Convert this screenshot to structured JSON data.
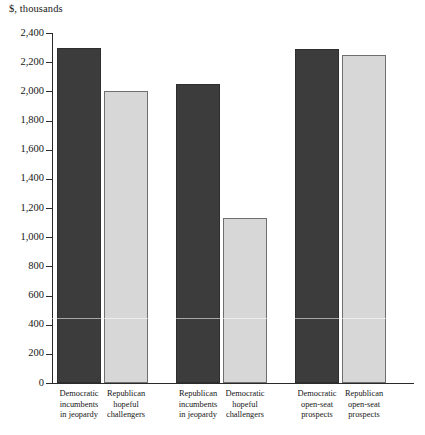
{
  "chart_data": {
    "type": "bar",
    "title": "",
    "subtitle": "",
    "axis_caption": "$, thousands",
    "xlabel": "",
    "ylabel": "$, thousands",
    "ylim": [
      0,
      2400
    ],
    "ytick_step": 200,
    "grid": false,
    "legend": "none",
    "categories": [
      "Democratic incumbents in jeopardy",
      "Republican hopeful challengers",
      "Republican incumbents in jeopardy",
      "Democratic hopeful challengers",
      "Democratic open-seat prospects",
      "Republican open-seat prospects"
    ],
    "category_lines": [
      [
        "Democratic",
        "incumbents",
        "in jeopardy"
      ],
      [
        "Republican",
        "hopeful",
        "challengers"
      ],
      [
        "Republican",
        "incumbents",
        "in jeopardy"
      ],
      [
        "Democratic",
        "hopeful",
        "challengers"
      ],
      [
        "Democratic",
        "open-seat",
        "prospects"
      ],
      [
        "Republican",
        "open-seat",
        "prospects"
      ]
    ],
    "values": [
      2300,
      2000,
      2050,
      1130,
      2290,
      2250
    ],
    "bar_styles": [
      "dark",
      "light",
      "dark",
      "light",
      "dark",
      "light"
    ],
    "y_tick_labels": [
      "2,400",
      "2,200",
      "2,000",
      "1,800",
      "1,600",
      "1,400",
      "1,200",
      "1,000",
      "800",
      "600",
      "400",
      "200",
      "0"
    ],
    "y_tick_values": [
      2400,
      2200,
      2000,
      1800,
      1600,
      1400,
      1200,
      1000,
      800,
      600,
      400,
      200,
      0
    ],
    "colors": {
      "dark_bar": "#3c3c3c",
      "dark_bar_border": "#2e2e2e",
      "light_bar": "#d7d7d7",
      "light_bar_border": "#6f6f6f",
      "axis": "#2a2a2a",
      "text": "#161616",
      "background": "#ffffff"
    },
    "bar_geometry": [
      {
        "left": 57,
        "width": 44
      },
      {
        "left": 104,
        "width": 44
      },
      {
        "left": 176,
        "width": 44
      },
      {
        "left": 223,
        "width": 44
      },
      {
        "left": 295,
        "width": 44
      },
      {
        "left": 342,
        "width": 44
      }
    ],
    "label_geometry": [
      {
        "left": 49,
        "width": 60
      },
      {
        "left": 96,
        "width": 60
      },
      {
        "left": 168,
        "width": 60
      },
      {
        "left": 215,
        "width": 60
      },
      {
        "left": 287,
        "width": 60
      },
      {
        "left": 334,
        "width": 60
      }
    ]
  }
}
